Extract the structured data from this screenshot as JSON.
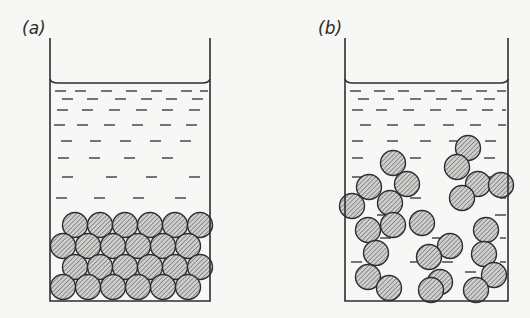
{
  "figure": {
    "panels": [
      {
        "id": "a",
        "label": "(a)",
        "description": "Particles settled in a close-packed sediment at the bottom of the liquid",
        "label_pos": [
          22,
          22
        ],
        "beaker": {
          "left": 50,
          "right": 210,
          "top": 38,
          "liquid_level": 83,
          "bottom": 301
        },
        "dash_rows": [
          {
            "y": 91,
            "xs": [
              55,
              75,
              101,
              126,
              151,
              181,
              200
            ]
          },
          {
            "y": 99,
            "xs": [
              62,
              87,
              115,
              141,
              166,
              192
            ]
          },
          {
            "y": 110,
            "xs": [
              57,
              82,
              109,
              136,
              162,
              189
            ]
          },
          {
            "y": 125,
            "xs": [
              54,
              77,
              104,
              132,
              160,
              186
            ]
          },
          {
            "y": 141,
            "xs": [
              61,
              90,
              120,
              150,
              180
            ]
          },
          {
            "y": 158,
            "xs": [
              58,
              89,
              124,
              162
            ]
          },
          {
            "y": 177,
            "xs": [
              62,
              106,
              146,
              189
            ]
          },
          {
            "y": 198,
            "xs": [
              56,
              94,
              133,
              175
            ]
          }
        ],
        "particles": [
          [
            75,
            225
          ],
          [
            100,
            225
          ],
          [
            125,
            225
          ],
          [
            150,
            225
          ],
          [
            175,
            225
          ],
          [
            200,
            225
          ],
          [
            63,
            246
          ],
          [
            88,
            246
          ],
          [
            113,
            246
          ],
          [
            138,
            246
          ],
          [
            163,
            246
          ],
          [
            188,
            246
          ],
          [
            75,
            267
          ],
          [
            100,
            267
          ],
          [
            125,
            267
          ],
          [
            150,
            267
          ],
          [
            175,
            267
          ],
          [
            200,
            267
          ],
          [
            63,
            287
          ],
          [
            88,
            287
          ],
          [
            113,
            287
          ],
          [
            138,
            287
          ],
          [
            163,
            287
          ],
          [
            188,
            287
          ]
        ]
      },
      {
        "id": "b",
        "label": "(b)",
        "description": "Particles forming a loose flocculated chain network throughout the liquid",
        "label_pos": [
          318,
          22
        ],
        "beaker": {
          "left": 345,
          "right": 508,
          "top": 38,
          "liquid_level": 83,
          "bottom": 301
        },
        "dash_rows": [
          {
            "y": 91,
            "xs": [
              350,
              374,
              398,
              424,
              451,
              476,
              497
            ]
          },
          {
            "y": 99,
            "xs": [
              358,
              383,
              410,
              436,
              461,
              484
            ]
          },
          {
            "y": 110,
            "xs": [
              352,
              376,
              403,
              430,
              456,
              482,
              502
            ]
          },
          {
            "y": 125,
            "xs": [
              360,
              387,
              414,
              443,
              470,
              498
            ]
          },
          {
            "y": 141,
            "xs": [
              352,
              387,
              420,
              449,
              485
            ]
          },
          {
            "y": 158,
            "xs": [
              352,
              410,
              484
            ]
          },
          {
            "y": 177,
            "xs": [
              352,
              400,
              452,
              480
            ]
          },
          {
            "y": 198,
            "xs": [
              410,
              455,
              500
            ]
          },
          {
            "y": 215,
            "xs": [
              377,
              413,
              495
            ]
          },
          {
            "y": 238,
            "xs": [
              380,
              432,
              480,
              500
            ]
          },
          {
            "y": 262,
            "xs": [
              351,
              410,
              442,
              500
            ]
          },
          {
            "y": 272,
            "xs": [
              465
            ]
          }
        ],
        "particles": [
          [
            393,
            163
          ],
          [
            407,
            184
          ],
          [
            369,
            187
          ],
          [
            390,
            203
          ],
          [
            352,
            206
          ],
          [
            368,
            230
          ],
          [
            393,
            225
          ],
          [
            422,
            223
          ],
          [
            376,
            253
          ],
          [
            450,
            246
          ],
          [
            368,
            277
          ],
          [
            389,
            288
          ],
          [
            429,
            257
          ],
          [
            440,
            282
          ],
          [
            431,
            290
          ],
          [
            468,
            148
          ],
          [
            457,
            167
          ],
          [
            478,
            184
          ],
          [
            501,
            185
          ],
          [
            462,
            198
          ],
          [
            486,
            230
          ],
          [
            484,
            254
          ],
          [
            494,
            275
          ],
          [
            476,
            290
          ]
        ]
      }
    ],
    "style": {
      "ink": "#2e2e2e",
      "particle_fill": "#c9c9c7",
      "hatch": "#555555",
      "background": "#f7f7f5",
      "particle_radius": 12.5
    }
  }
}
